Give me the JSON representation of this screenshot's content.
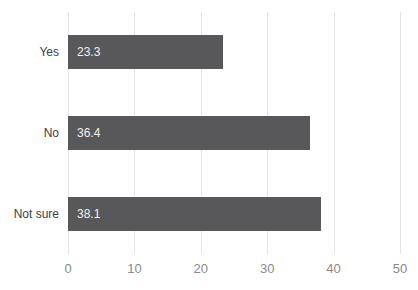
{
  "chart_data": {
    "type": "bar",
    "orientation": "horizontal",
    "title": "",
    "xlabel": "",
    "ylabel": "",
    "categories": [
      "Yes",
      "No",
      "Not sure"
    ],
    "values": [
      23.3,
      36.4,
      38.1
    ],
    "value_labels": [
      "23.3",
      "36.4",
      "38.1"
    ],
    "x_ticks": [
      0,
      10,
      20,
      30,
      40,
      50
    ],
    "xlim": [
      0,
      50
    ],
    "grid": "vertical-only",
    "legend": "none",
    "colors": {
      "background": "#ffffff",
      "bar": "#58585a",
      "value_label": "#f0f0f0",
      "category_label": "#3d3d3d",
      "tick_label": "#8a8a8a",
      "gridline": "#e4e4e4"
    }
  }
}
